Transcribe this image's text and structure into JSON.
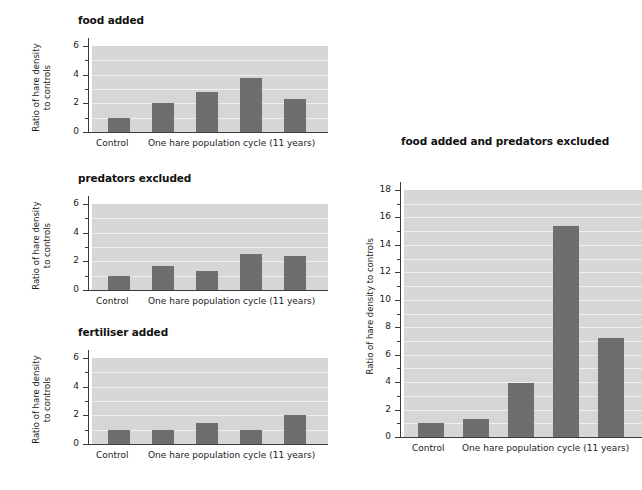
{
  "figure": {
    "bar_color": "#6e6e6e",
    "plot_background": "#d6d6d6",
    "gridline_color": "#efefef",
    "axis_color": "#3a3a3a"
  },
  "charts": [
    {
      "id": "food-added",
      "title": "food added",
      "ylabel": "Ratio of hare density\nto controls",
      "xlabel_left": "Control",
      "xlabel_right": "One hare population cycle (11 years)",
      "chart_data": {
        "type": "bar",
        "title": "food added",
        "xlabel": "",
        "ylabel": "Ratio of hare density to controls",
        "categories": [
          "Control",
          "cycle year 1",
          "cycle year 2",
          "cycle year 3",
          "cycle year 4"
        ],
        "values": [
          1.0,
          2.0,
          2.8,
          3.75,
          2.3
        ],
        "ylim": [
          0,
          6
        ],
        "yticks_major": [
          0,
          2,
          4,
          6
        ],
        "yticks_minor": [
          1,
          3,
          5
        ],
        "grid": true,
        "legend": "none"
      }
    },
    {
      "id": "predators-excluded",
      "title": "predators excluded",
      "ylabel": "Ratio of hare density\nto controls",
      "xlabel_left": "Control",
      "xlabel_right": "One hare population cycle (11 years)",
      "chart_data": {
        "type": "bar",
        "title": "predators excluded",
        "xlabel": "",
        "ylabel": "Ratio of hare density to controls",
        "categories": [
          "Control",
          "cycle year 1",
          "cycle year 2",
          "cycle year 3",
          "cycle year 4"
        ],
        "values": [
          1.0,
          1.7,
          1.35,
          2.5,
          2.4
        ],
        "ylim": [
          0,
          6
        ],
        "yticks_major": [
          0,
          2,
          4,
          6
        ],
        "yticks_minor": [
          1,
          3,
          5
        ],
        "grid": true,
        "legend": "none"
      }
    },
    {
      "id": "fertiliser-added",
      "title": "fertiliser added",
      "ylabel": "Ratio of hare density\nto controls",
      "xlabel_left": "Control",
      "xlabel_right": "One hare population cycle (11 years)",
      "chart_data": {
        "type": "bar",
        "title": "fertiliser added",
        "xlabel": "",
        "ylabel": "Ratio of hare density to controls",
        "categories": [
          "Control",
          "cycle year 1",
          "cycle year 2",
          "cycle year 3",
          "cycle year 4"
        ],
        "values": [
          1.0,
          1.0,
          1.5,
          1.0,
          2.05
        ],
        "ylim": [
          0,
          6
        ],
        "yticks_major": [
          0,
          2,
          4,
          6
        ],
        "yticks_minor": [
          1,
          3,
          5
        ],
        "grid": true,
        "legend": "none"
      }
    },
    {
      "id": "food-added-and-predators-excluded",
      "title": "food added and predators excluded",
      "ylabel": "Ratio of hare density to controls",
      "xlabel_left": "Control",
      "xlabel_right": "One hare population cycle (11 years)",
      "chart_data": {
        "type": "bar",
        "title": "food added and predators excluded",
        "xlabel": "",
        "ylabel": "Ratio of hare density to controls",
        "categories": [
          "Control",
          "cycle year 1",
          "cycle year 2",
          "cycle year 3",
          "cycle year 4"
        ],
        "values": [
          1.0,
          1.3,
          3.95,
          15.4,
          7.2
        ],
        "ylim": [
          0,
          18
        ],
        "yticks_major": [
          0,
          2,
          4,
          6,
          8,
          10,
          12,
          14,
          16,
          18
        ],
        "yticks_minor": [
          1,
          3,
          5,
          7,
          9,
          11,
          13,
          15,
          17
        ],
        "grid": true,
        "legend": "none"
      }
    }
  ]
}
